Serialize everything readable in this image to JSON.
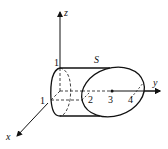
{
  "diagram": {
    "axes": {
      "x_label": "x",
      "y_label": "y",
      "z_label": "z"
    },
    "surface_label": "S",
    "tick_labels": {
      "z_tick": "1",
      "x_tick": "1",
      "y_ticks": [
        "2",
        "3",
        "4"
      ]
    },
    "colors": {
      "stroke": "#111111",
      "background": "#ffffff"
    }
  }
}
